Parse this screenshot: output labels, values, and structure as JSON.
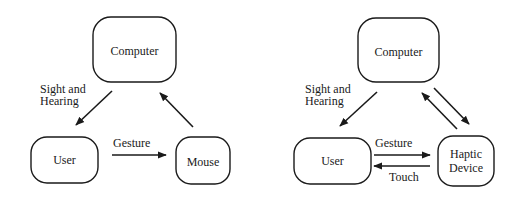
{
  "left_diagram": {
    "nodes": {
      "computer": "Computer",
      "user": "User",
      "device": "Mouse"
    },
    "edges": {
      "computer_to_user": {
        "label_line1": "Sight and",
        "label_line2": "Hearing"
      },
      "user_to_device": "Gesture"
    }
  },
  "right_diagram": {
    "nodes": {
      "computer": "Computer",
      "user": "User",
      "device_line1": "Haptic",
      "device_line2": "Device"
    },
    "edges": {
      "computer_to_user": {
        "label_line1": "Sight and",
        "label_line2": "Hearing"
      },
      "user_to_device": "Gesture",
      "device_to_user": "Touch"
    }
  },
  "colors": {
    "stroke": "#1a1a1a",
    "background": "#ffffff"
  }
}
